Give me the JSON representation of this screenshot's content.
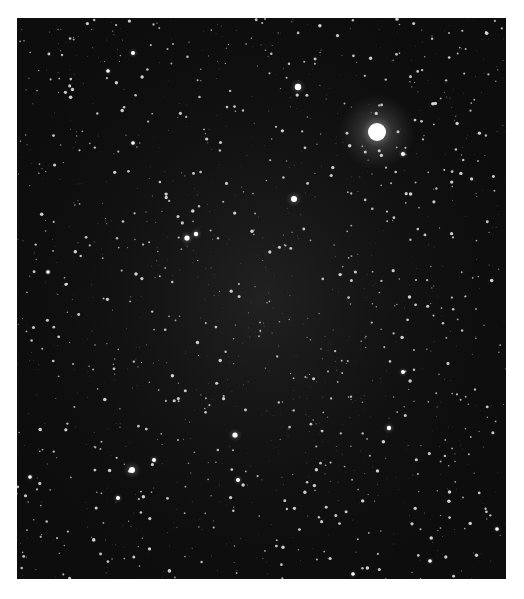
{
  "image": {
    "subject": "star field",
    "background_color": "#0d0d0d",
    "haze_color": "#2a2a2a",
    "frame": {
      "x": 17,
      "y": 18,
      "width": 489,
      "height": 561
    }
  },
  "bright_stars": [
    {
      "x": 360,
      "y": 114,
      "r": 9,
      "glow": 38
    },
    {
      "x": 281,
      "y": 69,
      "r": 3.2,
      "glow": 8
    },
    {
      "x": 277,
      "y": 181,
      "r": 3,
      "glow": 8
    },
    {
      "x": 170,
      "y": 220,
      "r": 2.6,
      "glow": 7
    },
    {
      "x": 179,
      "y": 216,
      "r": 2.2,
      "glow": 6
    },
    {
      "x": 115,
      "y": 452,
      "r": 3,
      "glow": 9
    },
    {
      "x": 218,
      "y": 417,
      "r": 2.6,
      "glow": 7
    },
    {
      "x": 137,
      "y": 442,
      "r": 2,
      "glow": 5
    },
    {
      "x": 221,
      "y": 462,
      "r": 2,
      "glow": 5
    },
    {
      "x": 101,
      "y": 480,
      "r": 2,
      "glow": 5
    },
    {
      "x": 386,
      "y": 136,
      "r": 2,
      "glow": 5
    },
    {
      "x": 386,
      "y": 354,
      "r": 2,
      "glow": 5
    },
    {
      "x": 372,
      "y": 410,
      "r": 2.2,
      "glow": 6
    },
    {
      "x": 116,
      "y": 35,
      "r": 2,
      "glow": 5
    },
    {
      "x": 91,
      "y": 53,
      "r": 1.8,
      "glow": 4
    },
    {
      "x": 116,
      "y": 125,
      "r": 1.8,
      "glow": 4
    },
    {
      "x": 31,
      "y": 254,
      "r": 1.8,
      "glow": 4
    },
    {
      "x": 13,
      "y": 459,
      "r": 1.8,
      "glow": 4
    },
    {
      "x": 480,
      "y": 511,
      "r": 1.8,
      "glow": 4
    },
    {
      "x": 336,
      "y": 556,
      "r": 1.8,
      "glow": 4
    },
    {
      "x": 413,
      "y": 543,
      "r": 1.8,
      "glow": 4
    }
  ],
  "faint_star_count": 1400,
  "faint_star_seed": 7
}
